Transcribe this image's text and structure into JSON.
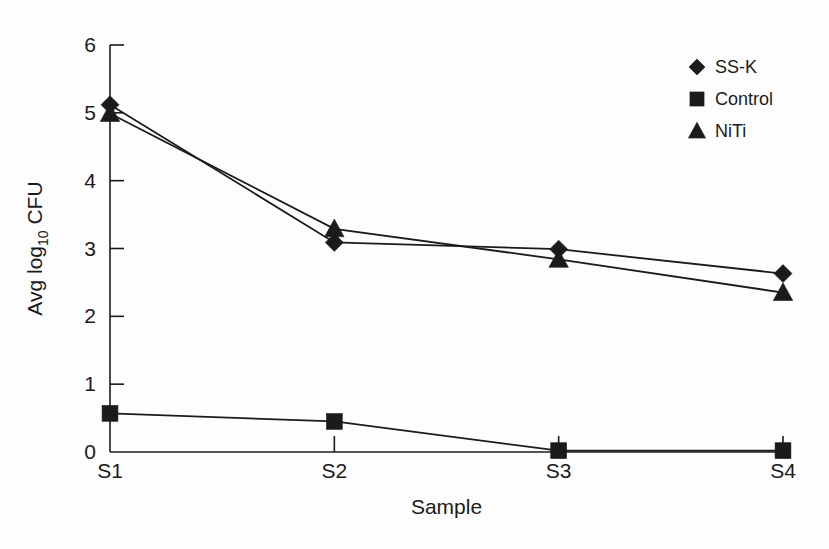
{
  "chart_data": {
    "type": "line",
    "title": "",
    "xlabel": "Sample",
    "ylabel": "Avg log10 CFU",
    "ylabel_main": "Avg log",
    "ylabel_sub": "10",
    "ylabel_tail": " CFU",
    "categories": [
      "S1",
      "S2",
      "S3",
      "S4"
    ],
    "ylim": [
      0,
      6
    ],
    "yticks": [
      0,
      1,
      2,
      3,
      4,
      5,
      6
    ],
    "ytick_labels": [
      "0",
      "1",
      "2",
      "3",
      "4",
      "5",
      "6"
    ],
    "grid": false,
    "legend_position": "top-right",
    "series": [
      {
        "name": "SS-K",
        "marker": "diamond",
        "color": "#1b1b1b",
        "values": [
          5.12,
          3.09,
          2.99,
          2.63
        ]
      },
      {
        "name": "Control",
        "marker": "square",
        "color": "#1b1b1b",
        "values": [
          0.57,
          0.45,
          0.02,
          0.02
        ]
      },
      {
        "name": "NiTi",
        "marker": "triangle",
        "color": "#1b1b1b",
        "values": [
          4.99,
          3.29,
          2.84,
          2.35
        ]
      }
    ]
  },
  "legend": {
    "items": [
      {
        "label": "SS-K",
        "marker": "diamond"
      },
      {
        "label": "Control",
        "marker": "square"
      },
      {
        "label": "NiTi",
        "marker": "triangle"
      }
    ]
  },
  "colors": {
    "ink": "#1b1b1b",
    "background": "#fdfdfd"
  }
}
